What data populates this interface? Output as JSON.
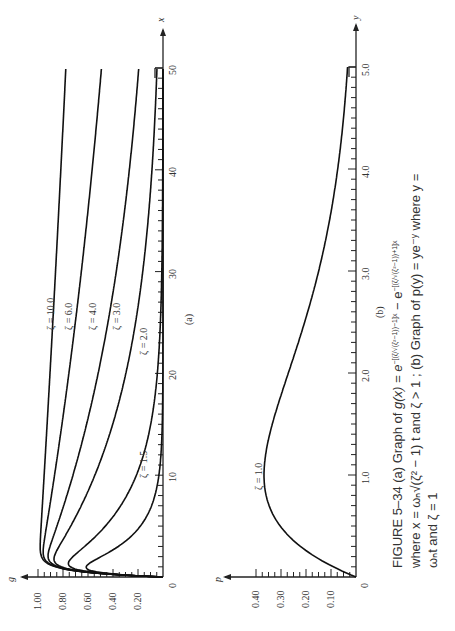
{
  "chart_data": [
    {
      "type": "line",
      "panel": "(a)",
      "title": "Graph of g(x) = e^{-[(ζ/√(ζ²−1))−1]x} − e^{-[(ζ/√(ζ²−1))+1]x}",
      "xlabel": "x",
      "ylabel": "g",
      "xlim": [
        0,
        50
      ],
      "ylim": [
        0,
        1.0
      ],
      "x_ticks": [
        "0",
        "10",
        "20",
        "30",
        "40",
        "50"
      ],
      "y_ticks": [
        "0",
        "0.20",
        "0.40",
        "0.60",
        "0.80",
        "1.00"
      ],
      "grid": false,
      "orientation": "rotated 90° counterclockwise",
      "series": [
        {
          "name": "ζ = 1.5",
          "zeta": 1.5,
          "x": [
            0,
            1,
            2,
            3,
            5,
            8,
            10,
            15,
            20,
            25,
            30
          ],
          "values": [
            0,
            0.61,
            0.5,
            0.36,
            0.18,
            0.06,
            0.03,
            0.006,
            0.001,
            0,
            0
          ]
        },
        {
          "name": "ζ = 2.0",
          "zeta": 2.0,
          "x": [
            0,
            1,
            2,
            3,
            5,
            8,
            10,
            15,
            20,
            25,
            30
          ],
          "values": [
            0,
            0.67,
            0.67,
            0.59,
            0.46,
            0.31,
            0.24,
            0.11,
            0.05,
            0.02,
            0.01
          ]
        },
        {
          "name": "ζ = 3.0",
          "zeta": 3.0,
          "x": [
            0,
            1,
            2,
            3,
            5,
            10,
            15,
            20,
            25,
            30,
            40,
            50
          ],
          "values": [
            0,
            0.78,
            0.87,
            0.84,
            0.77,
            0.59,
            0.45,
            0.35,
            0.27,
            0.21,
            0.12,
            0.07
          ]
        },
        {
          "name": "ζ = 4.0",
          "zeta": 4.0,
          "x": [
            0,
            1,
            2,
            3,
            5,
            10,
            15,
            20,
            25,
            30,
            40,
            50
          ],
          "values": [
            0,
            0.83,
            0.92,
            0.91,
            0.86,
            0.75,
            0.65,
            0.56,
            0.48,
            0.42,
            0.31,
            0.23
          ]
        },
        {
          "name": "ζ = 6.0",
          "zeta": 6.0,
          "x": [
            0,
            1,
            2,
            3,
            5,
            10,
            15,
            20,
            25,
            30,
            40,
            50
          ],
          "values": [
            0,
            0.85,
            0.96,
            0.96,
            0.93,
            0.87,
            0.81,
            0.76,
            0.7,
            0.66,
            0.57,
            0.5
          ]
        },
        {
          "name": "ζ = 10.0",
          "zeta": 10.0,
          "x": [
            0,
            1,
            2,
            3,
            5,
            10,
            15,
            20,
            25,
            30,
            40,
            50
          ],
          "values": [
            0,
            0.86,
            0.98,
            0.98,
            0.97,
            0.95,
            0.92,
            0.9,
            0.88,
            0.86,
            0.82,
            0.78
          ]
        }
      ]
    },
    {
      "type": "line",
      "panel": "(b)",
      "title": "Graph of p(y) = y e^{-y}",
      "xlabel": "y",
      "ylabel": "p",
      "xlim": [
        0,
        5.0
      ],
      "ylim": [
        0,
        0.4
      ],
      "x_ticks": [
        "0",
        "1.0",
        "2.0",
        "3.0",
        "4.0",
        "5.0"
      ],
      "y_ticks": [
        "0",
        "0.10",
        "0.20",
        "0.30",
        "0.40"
      ],
      "grid": false,
      "orientation": "rotated 90° counterclockwise",
      "series": [
        {
          "name": "ζ = 1.0",
          "zeta": 1.0,
          "x": [
            0,
            0.25,
            0.5,
            0.75,
            1.0,
            1.25,
            1.5,
            2.0,
            2.5,
            3.0,
            3.5,
            4.0,
            4.5,
            5.0
          ],
          "values": [
            0,
            0.195,
            0.303,
            0.354,
            0.368,
            0.358,
            0.335,
            0.271,
            0.205,
            0.149,
            0.106,
            0.073,
            0.05,
            0.034
          ]
        }
      ]
    }
  ],
  "panel_a": {
    "y_axis_name": "g",
    "x_axis_name": "x",
    "panel_label": "(a)",
    "y_tick_labels": [
      "1.00",
      "0.80",
      "0.60",
      "0.40",
      "0.20"
    ],
    "origin_label": "0",
    "x_tick_labels": [
      "10",
      "20",
      "30",
      "40",
      "50"
    ],
    "curve_labels": [
      "ζ = 10.0",
      "ζ = 6.0",
      "ζ = 4.0",
      "ζ = 3.0",
      "ζ = 2.0",
      "ζ = 1.5"
    ]
  },
  "panel_b": {
    "y_axis_name": "p",
    "x_axis_name": "y",
    "panel_label": "(b)",
    "y_tick_labels": [
      "0.40",
      "0.30",
      "0.20",
      "0.10"
    ],
    "origin_label": "0",
    "x_tick_labels": [
      "1.0",
      "2.0",
      "3.0",
      "4.0",
      "5.0"
    ],
    "curve_label": "ζ = 1.0"
  },
  "caption": {
    "line1": "FIGURE 5–34   (a)  Graph   of   g(x) = e^−[(ζ/√(ζ²−1))−1]x − e^−[(ζ/√(ζ²−1))+1]x",
    "line1_a": "FIGURE 5–34   (a)   Graph   of   ",
    "line1_b": "g(x) = e",
    "line1_sup1": "−[(ζ/√(ζ²−1))−1]x",
    "line1_c": " − e",
    "line1_sup2": "−[(ζ/√(ζ²−1))+1]x",
    "line2": "where x = ωₙ√(ζ² − 1) t and ζ > 1 ; (b) Graph of p(y) = ye⁻ʸ where y =",
    "line3": "ωₙt and ζ = 1"
  }
}
